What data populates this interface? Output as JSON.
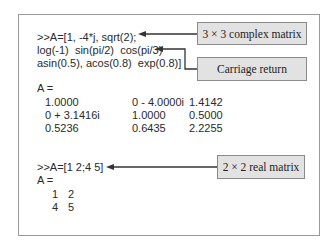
{
  "block1": {
    "lines": [
      ">>A=[1, -4*j, sqrt(2);",
      "log(-1)  sin(pi/2)  cos(pi/3)",
      "asin(0.5), acos(0.8)  exp(0.8)]"
    ],
    "result_label": "A =",
    "matrix": [
      [
        "1.0000",
        "0 - 4.0000i",
        "1.4142"
      ],
      [
        "0 + 3.1416i",
        "1.0000",
        "0.5000"
      ],
      [
        "0.5236",
        "0.6435",
        "2.2255"
      ]
    ]
  },
  "block2": {
    "line": ">>A=[1 2;4 5]",
    "result_label": "A =",
    "matrix": [
      [
        "1",
        "2"
      ],
      [
        "4",
        "5"
      ]
    ]
  },
  "callouts": {
    "complex": "3 × 3 complex matrix",
    "carriage": "Carriage return",
    "real": "2 × 2 real matrix"
  },
  "colors": {
    "callout_bg": "#e2e2e2",
    "arrow": "#333333",
    "border": "#9a9a9a"
  }
}
